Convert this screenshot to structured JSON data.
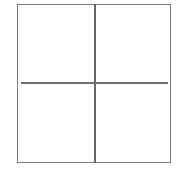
{
  "diagram": {
    "type": "grid",
    "rows": 2,
    "columns": 2,
    "quadrants": [
      {
        "position": "top-left",
        "label": ""
      },
      {
        "position": "top-right",
        "label": ""
      },
      {
        "position": "bottom-left",
        "label": ""
      },
      {
        "position": "bottom-right",
        "label": ""
      }
    ],
    "colors": {
      "background": "#ffffff",
      "border": "#7a7a7a",
      "divider": "#666666"
    }
  }
}
